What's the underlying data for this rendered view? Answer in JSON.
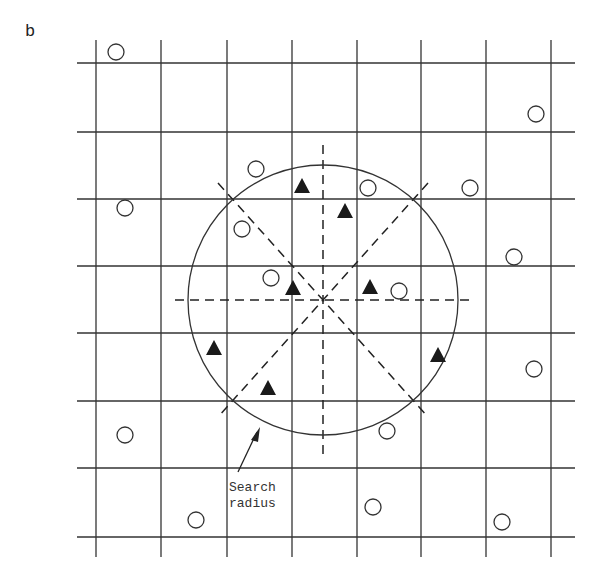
{
  "panel_label": "b",
  "annotation": {
    "line1": "Search",
    "line2": "radius"
  },
  "grid": {
    "x_lines": [
      96,
      161,
      227,
      292,
      357,
      421,
      486,
      551
    ],
    "y_lines": [
      63,
      132,
      199,
      266,
      333,
      401,
      468,
      537
    ],
    "x_extent": [
      77,
      575
    ],
    "y_extent": [
      40,
      557
    ]
  },
  "search_circle": {
    "cx": 323,
    "cy": 300,
    "r": 135
  },
  "colors": {
    "line": "#333333",
    "marker": "#1a1a1a",
    "background": "#ffffff"
  },
  "open_circles": [
    [
      116,
      52
    ],
    [
      125,
      208
    ],
    [
      536,
      114
    ],
    [
      256,
      169
    ],
    [
      368,
      188
    ],
    [
      470,
      188
    ],
    [
      242,
      229
    ],
    [
      271,
      278
    ],
    [
      399,
      291
    ],
    [
      514,
      257
    ],
    [
      534,
      369
    ],
    [
      387,
      431
    ],
    [
      125,
      435
    ],
    [
      196,
      520
    ],
    [
      373,
      507
    ],
    [
      502,
      522
    ]
  ],
  "triangles": [
    [
      302,
      186
    ],
    [
      345,
      211
    ],
    [
      293,
      288
    ],
    [
      370,
      287
    ],
    [
      214,
      348
    ],
    [
      268,
      388
    ],
    [
      438,
      355
    ]
  ]
}
